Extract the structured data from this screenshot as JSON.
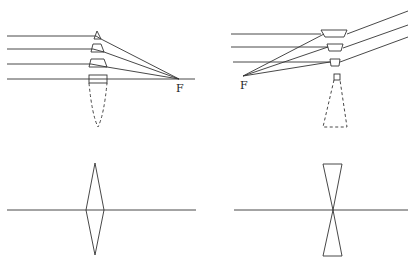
{
  "figure": {
    "panels": [
      {
        "id": "converging-prism-model",
        "focal_label": "F",
        "description": "Parallel rays through a stack of prisms converge to focal point F"
      },
      {
        "id": "diverging-prism-model",
        "focal_label": "F",
        "description": "Parallel rays through inverted prisms diverge; virtual focal point F"
      },
      {
        "id": "converging-lens-symbol",
        "description": "Double-convex lens symbol on optical axis"
      },
      {
        "id": "diverging-lens-symbol",
        "description": "Double-concave lens symbol on optical axis"
      }
    ],
    "colors": {
      "stroke": "#333333",
      "background": "#ffffff"
    }
  }
}
